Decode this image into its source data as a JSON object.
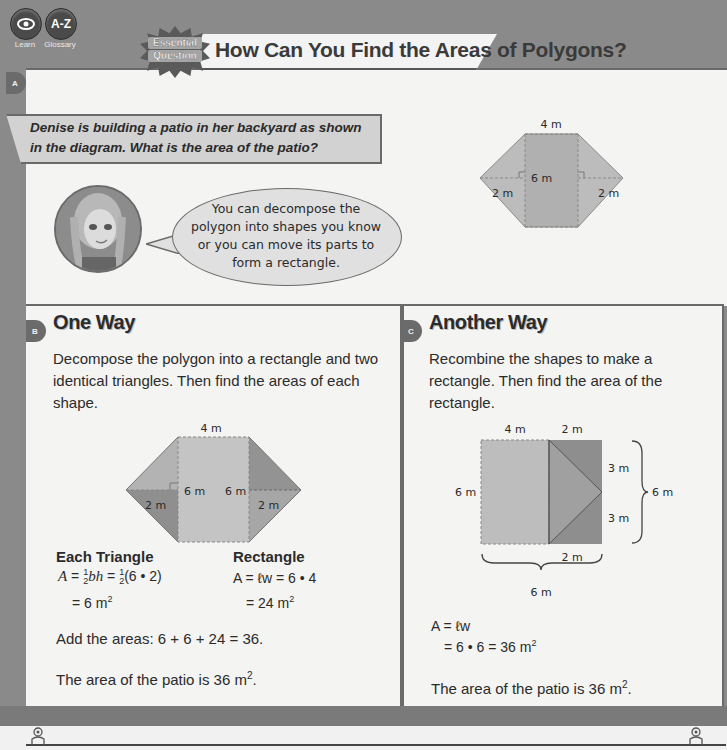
{
  "nav": {
    "learn": {
      "label": "Learn",
      "icon": "eye-icon"
    },
    "glossary": {
      "label": "Glossary",
      "icon_text": "A-Z"
    }
  },
  "header": {
    "badge_line1": "Essential",
    "badge_line2": "Question",
    "title": "How Can You Find the Areas of Polygons?"
  },
  "section_a": {
    "letter": "A",
    "problem": "Denise is building a patio in her backyard as shown in the diagram. What is the area of the patio?",
    "speech": "You can decompose the polygon into shapes you know or you can move its parts to form a rectangle.",
    "diagram": {
      "top": "4 m",
      "height": "6 m",
      "left_base": "2 m",
      "right_base": "2 m"
    }
  },
  "section_b": {
    "letter": "B",
    "heading": "One Way",
    "intro": "Decompose the polygon into a rectangle and two identical triangles. Then find the areas of each shape.",
    "diagram": {
      "top": "4 m",
      "left_height": "6 m",
      "right_height": "6 m",
      "left_base": "2 m",
      "right_base": "2 m"
    },
    "triangle": {
      "heading": "Each Triangle",
      "line1_prefix": "A = ",
      "line1_a": "bh = ",
      "line1_b": "(6 • 2)",
      "frac_num": "1",
      "frac_den": "2",
      "line2": "= 6 m",
      "sup": "2"
    },
    "rectangle": {
      "heading": "Rectangle",
      "line1": "A = ℓw = 6 • 4",
      "line2": "= 24 m",
      "sup": "2"
    },
    "sum": "Add the areas: 6 + 6 + 24 = 36.",
    "conclusion": "The area of the patio is 36 m",
    "conclusion_sup": "2",
    "conclusion_end": "."
  },
  "section_c": {
    "letter": "C",
    "heading": "Another Way",
    "intro": "Recombine the shapes to make a rectangle. Then find the area of the rectangle.",
    "diagram": {
      "top_left": "4 m",
      "top_right": "2 m",
      "left": "6 m",
      "upper_right": "3 m",
      "lower_right": "3 m",
      "brace_right": "6 m",
      "bottom_inner": "2 m",
      "brace_bottom": "6 m"
    },
    "formula1": "A = ℓw",
    "formula2": "= 6 • 6 = 36 m",
    "formula_sup": "2",
    "conclusion": "The area of the patio is 36 m",
    "conclusion_sup": "2",
    "conclusion_end": "."
  },
  "colors": {
    "background": "#8a8a8a",
    "panel": "#f4f4f2",
    "shape_light": "#bdbdbd",
    "shape_mid": "#a8a8a8",
    "shape_dark": "#8f8f8f"
  }
}
